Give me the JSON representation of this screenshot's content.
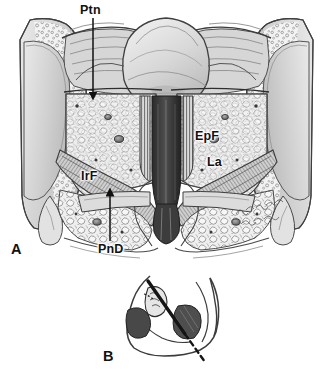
{
  "figure": {
    "kind": "medical-illustration",
    "technique": "grayscale pen-and-ink / wash anatomical drawing",
    "background_color": "#ffffff",
    "ink_color": "#1a1a1a",
    "artist_signature": "H. o. M. Mahler (handwritten cursive, illegible)"
  },
  "panels": [
    {
      "id": "A",
      "label": "A",
      "label_position": {
        "x": 11,
        "y": 242
      },
      "view": "coronal section through the female pelvis",
      "description": "Frontal (coronal) section showing midline pelvic viscera flanked by cut pelvic bones with cancellous bone stippling, fat-filled paravaginal spaces, and levator ani musculature."
    },
    {
      "id": "B",
      "label": "B",
      "label_position": {
        "x": 103,
        "y": 349
      },
      "view": "sagittal orientation inset",
      "description": "Small midsagittal pelvis outline with shaded viscera; a heavy solid line continuing as a dashed line marks the plane of the section shown in panel A."
    }
  ],
  "labels": [
    {
      "id": "ptn",
      "text": "Ptn",
      "meaning": "peritoneum",
      "panel": "A",
      "position": {
        "x": 80,
        "y": 4
      },
      "leader": {
        "type": "arrow",
        "x1": 93,
        "y1": 18,
        "x2": 93,
        "y2": 96,
        "direction": "down"
      }
    },
    {
      "id": "epf",
      "text": "EpF",
      "meaning": "extraperitoneal fat",
      "panel": "A",
      "position": {
        "x": 195,
        "y": 130
      },
      "leader": {
        "type": "none"
      }
    },
    {
      "id": "la",
      "text": "La",
      "meaning": "levator ani",
      "panel": "A",
      "position": {
        "x": 207,
        "y": 156
      },
      "leader": {
        "type": "none"
      }
    },
    {
      "id": "irf",
      "text": "IrF",
      "meaning": "ischiorectal fossa fat",
      "panel": "A",
      "position": {
        "x": 81,
        "y": 170
      },
      "leader": {
        "type": "none"
      }
    },
    {
      "id": "pnd",
      "text": "PnD",
      "meaning": "perineal diaphragm",
      "panel": "A",
      "position": {
        "x": 98,
        "y": 243
      },
      "leader": {
        "type": "arrow",
        "x1": 110,
        "y1": 241,
        "x2": 110,
        "y2": 192,
        "direction": "up"
      }
    }
  ]
}
